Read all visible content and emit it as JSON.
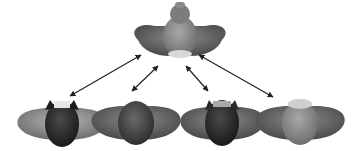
{
  "diagram": {
    "type": "one-to-many relationship",
    "top_node": {
      "id": "source",
      "description": "gray winged shape with knob on top and light base"
    },
    "bottom_nodes": [
      {
        "id": "variant-1",
        "description": "light wings with dark body and horned top"
      },
      {
        "id": "variant-2",
        "description": "medium gray wings with dark round body"
      },
      {
        "id": "variant-3",
        "description": "medium wings with dark body and horned top"
      },
      {
        "id": "variant-4",
        "description": "medium wings with light round body"
      }
    ],
    "edges": [
      {
        "from": "source",
        "to": "variant-1",
        "style": "double-arrow"
      },
      {
        "from": "source",
        "to": "variant-2",
        "style": "double-arrow"
      },
      {
        "from": "source",
        "to": "variant-3",
        "style": "double-arrow"
      },
      {
        "from": "source",
        "to": "variant-4",
        "style": "double-arrow"
      }
    ]
  }
}
